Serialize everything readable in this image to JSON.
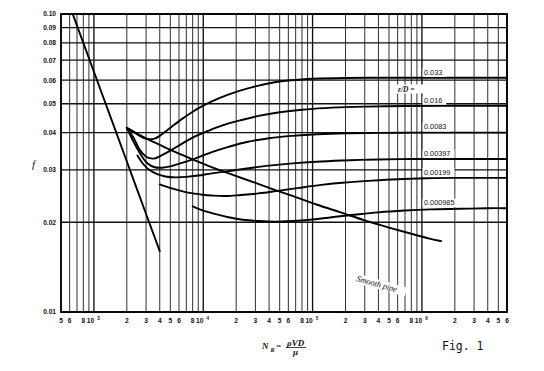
{
  "figure": {
    "caption": "Fig. 1",
    "y_axis_symbol": "f",
    "x_axis_symbol": "N",
    "x_axis_subscript": "R",
    "x_axis_equals": "=",
    "x_axis_numerator": "ρVD",
    "x_axis_denominator": "μ",
    "smooth_pipe_label": "Smooth pipe",
    "eps_over_d_prefix": "ε/D ="
  },
  "chart_data": {
    "type": "line",
    "title": "",
    "subtitle": "",
    "xlabel": "N_R = ρVD/μ",
    "ylabel": "f",
    "xscale": "log",
    "yscale": "log",
    "xlim": [
      500,
      6000000
    ],
    "ylim": [
      0.01,
      0.1
    ],
    "grid": true,
    "legend_position": "right-inline",
    "annotations": [
      "Smooth pipe",
      "ε/D = 0.033",
      "Fig. 1"
    ],
    "y_tick_labels": [
      "0.10",
      "0.09",
      "0.08",
      "0.07",
      "0.06",
      "0.05",
      "0.04",
      "0.03",
      "0.02",
      "0.01"
    ],
    "y_tick_values": [
      0.1,
      0.09,
      0.08,
      0.07,
      0.06,
      0.05,
      0.04,
      0.03,
      0.02,
      0.01
    ],
    "x_tick_labels": [
      {
        "text": "5",
        "value": 500,
        "sup": ""
      },
      {
        "text": "6",
        "value": 600,
        "sup": ""
      },
      {
        "text": "8",
        "value": 800,
        "sup": ""
      },
      {
        "text": "10",
        "value": 1000,
        "sup": "3"
      },
      {
        "text": "2",
        "value": 2000,
        "sup": ""
      },
      {
        "text": "3",
        "value": 3000,
        "sup": ""
      },
      {
        "text": "4",
        "value": 4000,
        "sup": ""
      },
      {
        "text": "5",
        "value": 5000,
        "sup": ""
      },
      {
        "text": "6",
        "value": 6000,
        "sup": ""
      },
      {
        "text": "8",
        "value": 8000,
        "sup": ""
      },
      {
        "text": "10",
        "value": 10000,
        "sup": "4"
      },
      {
        "text": "2",
        "value": 20000,
        "sup": ""
      },
      {
        "text": "3",
        "value": 30000,
        "sup": ""
      },
      {
        "text": "4",
        "value": 40000,
        "sup": ""
      },
      {
        "text": "5",
        "value": 50000,
        "sup": ""
      },
      {
        "text": "6",
        "value": 60000,
        "sup": ""
      },
      {
        "text": "8",
        "value": 80000,
        "sup": ""
      },
      {
        "text": "10",
        "value": 100000,
        "sup": "5"
      },
      {
        "text": "2",
        "value": 200000,
        "sup": ""
      },
      {
        "text": "3",
        "value": 300000,
        "sup": ""
      },
      {
        "text": "4",
        "value": 400000,
        "sup": ""
      },
      {
        "text": "5",
        "value": 500000,
        "sup": ""
      },
      {
        "text": "6",
        "value": 600000,
        "sup": ""
      },
      {
        "text": "8",
        "value": 800000,
        "sup": ""
      },
      {
        "text": "10",
        "value": 1000000,
        "sup": "6"
      },
      {
        "text": "2",
        "value": 2000000,
        "sup": ""
      },
      {
        "text": "3",
        "value": 3000000,
        "sup": ""
      },
      {
        "text": "4",
        "value": 4000000,
        "sup": ""
      },
      {
        "text": "5",
        "value": 5000000,
        "sup": ""
      },
      {
        "text": "6",
        "value": 6000000,
        "sup": ""
      }
    ],
    "series": [
      {
        "name": "laminar",
        "label": "",
        "x": [
          500,
          700,
          1000,
          1500,
          2000,
          2500,
          3000,
          3500,
          4000
        ],
        "y": [
          0.128,
          0.0914,
          0.064,
          0.0427,
          0.032,
          0.0256,
          0.02133,
          0.01829,
          0.016
        ]
      },
      {
        "name": "eps_0.033",
        "label": "0.033",
        "x": [
          2000,
          2400,
          2800,
          3200,
          3600,
          4000,
          5000,
          6000,
          8000,
          10000,
          14000,
          20000,
          30000,
          45000,
          60000,
          100000,
          200000,
          500000,
          1000000,
          3000000,
          6000000
        ],
        "y": [
          0.0415,
          0.0398,
          0.0385,
          0.038,
          0.0382,
          0.039,
          0.0415,
          0.0437,
          0.047,
          0.0493,
          0.0522,
          0.0548,
          0.0572,
          0.059,
          0.0598,
          0.0606,
          0.061,
          0.0611,
          0.0611,
          0.0611,
          0.0611
        ]
      },
      {
        "name": "eps_0.016",
        "label": "0.016",
        "x": [
          2000,
          2300,
          2600,
          3000,
          3500,
          4000,
          5000,
          6000,
          8000,
          11000,
          15000,
          22000,
          32000,
          50000,
          80000,
          150000,
          300000,
          700000,
          1500000,
          3000000,
          6000000
        ],
        "y": [
          0.0415,
          0.0385,
          0.0352,
          0.0332,
          0.0327,
          0.0333,
          0.0348,
          0.0362,
          0.0385,
          0.0405,
          0.0423,
          0.044,
          0.0455,
          0.0468,
          0.0477,
          0.0485,
          0.0489,
          0.0491,
          0.0492,
          0.0492,
          0.0492
        ]
      },
      {
        "name": "eps_0.0083",
        "label": "0.0083",
        "x": [
          2000,
          2300,
          2700,
          3100,
          3600,
          4200,
          5000,
          6500,
          8500,
          12000,
          17000,
          25000,
          40000,
          65000,
          110000,
          200000,
          400000,
          900000,
          2000000,
          4000000,
          6000000
        ],
        "y": [
          0.0415,
          0.0373,
          0.0336,
          0.0315,
          0.0306,
          0.0305,
          0.0308,
          0.0317,
          0.0328,
          0.0344,
          0.0358,
          0.0372,
          0.0383,
          0.039,
          0.0395,
          0.0398,
          0.0399,
          0.04,
          0.04,
          0.04,
          0.04
        ]
      },
      {
        "name": "eps_0.00397",
        "label": "0.00397",
        "x": [
          2500,
          2800,
          3200,
          3800,
          4500,
          5500,
          7000,
          9000,
          12000,
          17000,
          25000,
          40000,
          70000,
          120000,
          220000,
          400000,
          800000,
          1600000,
          3000000,
          5000000,
          6000000
        ],
        "y": [
          0.0335,
          0.0315,
          0.03,
          0.029,
          0.0285,
          0.0283,
          0.0284,
          0.0287,
          0.0292,
          0.0297,
          0.0303,
          0.031,
          0.0316,
          0.032,
          0.0323,
          0.0325,
          0.0326,
          0.0326,
          0.0326,
          0.0326,
          0.0326
        ]
      },
      {
        "name": "eps_0.00199",
        "label": "0.00199",
        "x": [
          4000,
          4800,
          6000,
          7500,
          9500,
          12000,
          16000,
          22000,
          32000,
          48000,
          75000,
          120000,
          200000,
          350000,
          600000,
          1100000,
          2000000,
          3500000,
          6000000
        ],
        "y": [
          0.0268,
          0.0262,
          0.0256,
          0.0251,
          0.0248,
          0.0246,
          0.0245,
          0.0247,
          0.025,
          0.0255,
          0.0261,
          0.0267,
          0.0272,
          0.0276,
          0.0279,
          0.0281,
          0.0282,
          0.0282,
          0.0282
        ]
      },
      {
        "name": "eps_0.000985",
        "label": "0.000985",
        "x": [
          8000,
          10000,
          13000,
          17000,
          23000,
          32000,
          45000,
          65000,
          95000,
          150000,
          240000,
          400000,
          700000,
          1200000,
          2200000,
          4000000,
          6000000
        ],
        "y": [
          0.0226,
          0.0219,
          0.0213,
          0.0208,
          0.0204,
          0.0202,
          0.0201,
          0.0202,
          0.0204,
          0.0208,
          0.0212,
          0.0216,
          0.0219,
          0.0221,
          0.0222,
          0.0223,
          0.0223
        ]
      },
      {
        "name": "smooth_pipe",
        "label": "Smooth pipe",
        "x": [
          2000,
          2600,
          3200,
          4000,
          5000,
          6500,
          8500,
          11000,
          15000,
          21000,
          30000,
          45000,
          70000,
          110000,
          180000,
          300000,
          500000,
          800000,
          1200000,
          1500000
        ],
        "y": [
          0.0415,
          0.0393,
          0.0378,
          0.0364,
          0.035,
          0.0336,
          0.0322,
          0.031,
          0.0297,
          0.0284,
          0.0271,
          0.0257,
          0.0243,
          0.0229,
          0.0216,
          0.0203,
          0.0192,
          0.0183,
          0.0176,
          0.0173
        ]
      }
    ],
    "inline_labels": [
      {
        "text": "0.033",
        "value": 0.0611
      },
      {
        "text": "0.016",
        "value": 0.0492
      },
      {
        "text": "0.0083",
        "value": 0.04
      },
      {
        "text": "0.00397",
        "value": 0.0326
      },
      {
        "text": "0.00199",
        "value": 0.0282
      },
      {
        "text": "0.000985",
        "value": 0.0223
      }
    ]
  }
}
